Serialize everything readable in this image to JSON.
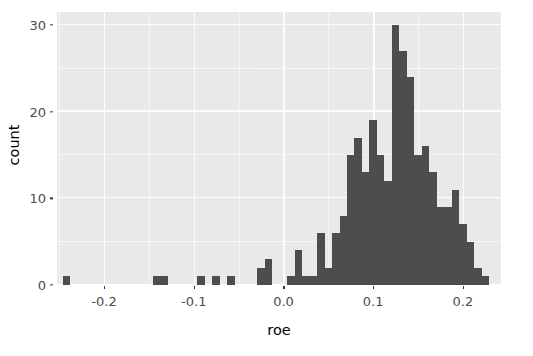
{
  "chart_data": {
    "type": "bar",
    "title": "",
    "subtitle": "",
    "xlabel": "roe",
    "ylabel": "count",
    "xlim": [
      -0.2525,
      0.2425
    ],
    "ylim": [
      0,
      31.5
    ],
    "grid": true,
    "legend": null,
    "bin_width": 0.00833,
    "x_ticks": [
      -0.2,
      -0.1,
      0.0,
      0.1,
      0.2
    ],
    "x_tick_labels": [
      "-0.2",
      "-0.1",
      "0.0",
      "0.1",
      "0.2"
    ],
    "y_ticks": [
      0,
      10,
      20,
      30
    ],
    "y_tick_labels": [
      "0",
      "10",
      "20",
      "30"
    ],
    "bar_color": "#4d4d4d",
    "panel_color": "#ebebeb",
    "grid_color": "#ffffff",
    "bins": [
      {
        "x": -0.2417,
        "count": 1
      },
      {
        "x": -0.1417,
        "count": 1
      },
      {
        "x": -0.1333,
        "count": 1
      },
      {
        "x": -0.0917,
        "count": 1
      },
      {
        "x": -0.075,
        "count": 1
      },
      {
        "x": -0.0583,
        "count": 1
      },
      {
        "x": -0.025,
        "count": 2
      },
      {
        "x": -0.0167,
        "count": 3
      },
      {
        "x": 0.0083,
        "count": 1
      },
      {
        "x": 0.0167,
        "count": 4
      },
      {
        "x": 0.025,
        "count": 1
      },
      {
        "x": 0.0333,
        "count": 1
      },
      {
        "x": 0.0417,
        "count": 6
      },
      {
        "x": 0.05,
        "count": 2
      },
      {
        "x": 0.0583,
        "count": 6
      },
      {
        "x": 0.0667,
        "count": 8
      },
      {
        "x": 0.075,
        "count": 15
      },
      {
        "x": 0.0833,
        "count": 17
      },
      {
        "x": 0.0917,
        "count": 13
      },
      {
        "x": 0.1,
        "count": 19
      },
      {
        "x": 0.1083,
        "count": 15
      },
      {
        "x": 0.1167,
        "count": 12
      },
      {
        "x": 0.125,
        "count": 30
      },
      {
        "x": 0.1333,
        "count": 27
      },
      {
        "x": 0.1417,
        "count": 24
      },
      {
        "x": 0.15,
        "count": 15
      },
      {
        "x": 0.1583,
        "count": 16
      },
      {
        "x": 0.1667,
        "count": 13
      },
      {
        "x": 0.175,
        "count": 9
      },
      {
        "x": 0.1833,
        "count": 9
      },
      {
        "x": 0.1917,
        "count": 11
      },
      {
        "x": 0.2,
        "count": 7
      },
      {
        "x": 0.2083,
        "count": 5
      },
      {
        "x": 0.2167,
        "count": 2
      },
      {
        "x": 0.225,
        "count": 1
      }
    ]
  },
  "axis": {
    "x_title": "roe",
    "y_title": "count"
  }
}
